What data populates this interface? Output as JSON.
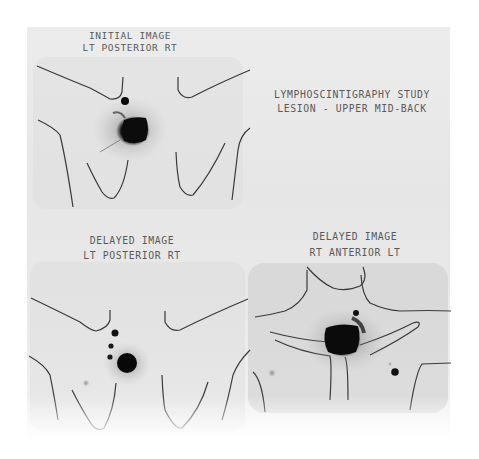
{
  "figure": {
    "title_line1": "LYMPHOSCINTIGRAPHY STUDY",
    "title_line2": "LESION - UPPER MID-BACK"
  },
  "panels": [
    {
      "id": "initial-posterior",
      "line1": "INITIAL IMAGE",
      "line2": "LT POSTERIOR RT"
    },
    {
      "id": "delayed-posterior",
      "line1": "DELAYED IMAGE",
      "line2": "LT POSTERIOR RT"
    },
    {
      "id": "delayed-anterior",
      "line1": "DELAYED IMAGE",
      "line2": "RT ANTERIOR LT"
    }
  ],
  "colors": {
    "film": "#e8e8e8",
    "outline": "#3a3a3a",
    "uptake": "#0a0a0a",
    "text": "#5a5a5a"
  }
}
